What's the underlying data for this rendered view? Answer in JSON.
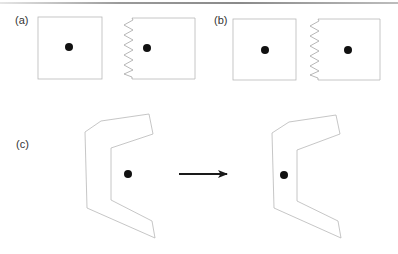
{
  "figure": {
    "panels": [
      {
        "id": "a",
        "label": "(a)",
        "description": "Free square with centered point; square with spring (zigzag) attached on left edge, point centered",
        "shapes": [
          {
            "type": "square",
            "x": 38,
            "y": 17,
            "w": 64,
            "h": 62,
            "dot": [
              69,
              47
            ]
          },
          {
            "type": "square-with-spring",
            "x": 132,
            "y": 18,
            "w": 63,
            "h": 61,
            "spring_side": "left",
            "dot": [
              147,
              48
            ]
          }
        ]
      },
      {
        "id": "b",
        "label": "(b)",
        "description": "Square with centered point; spring-attached square with point further from spring",
        "shapes": [
          {
            "type": "square",
            "x": 233,
            "y": 19,
            "w": 63,
            "h": 61,
            "dot": [
              265,
              50
            ]
          },
          {
            "type": "square-with-spring",
            "x": 318,
            "y": 19,
            "w": 62,
            "h": 61,
            "spring_side": "left",
            "dot": [
              348,
              50
            ]
          }
        ]
      },
      {
        "id": "c",
        "label": "(c)",
        "description": "C-shaped (bracket) polygon with point outside in the concave region, transformed to point located inside the polygon's left arm",
        "shapes": [
          {
            "type": "c-polygon",
            "dot": [
              128,
              174
            ]
          },
          {
            "type": "arrow",
            "from": [
              179,
              174
            ],
            "to": [
              227,
              174
            ]
          },
          {
            "type": "c-polygon",
            "dot": [
              284,
              175
            ]
          }
        ]
      }
    ],
    "colors": {
      "outline": "#b8b8b8",
      "dot": "#111111",
      "arrow": "#1a1a1a",
      "label": "#333333"
    }
  }
}
